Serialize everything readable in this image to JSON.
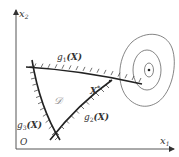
{
  "diagram": {
    "axes": {
      "x_label": "x",
      "x_sub": "1",
      "y_label": "x",
      "y_sub": "2",
      "origin_label": "O"
    },
    "region_label": "𝒟",
    "optimum_label": "X",
    "optimum_sup": "*",
    "constraints": [
      {
        "id": "g1",
        "prefix": "g",
        "sub": "1",
        "arg": "(X)"
      },
      {
        "id": "g2",
        "prefix": "g",
        "sub": "2",
        "arg": "(X)"
      },
      {
        "id": "g3",
        "prefix": "g",
        "sub": "3",
        "arg": "(X)"
      }
    ],
    "contours": {
      "count": 3,
      "has_center_point": true
    },
    "colors": {
      "line": "#333333",
      "contour": "#666666",
      "background": "#ffffff"
    }
  }
}
